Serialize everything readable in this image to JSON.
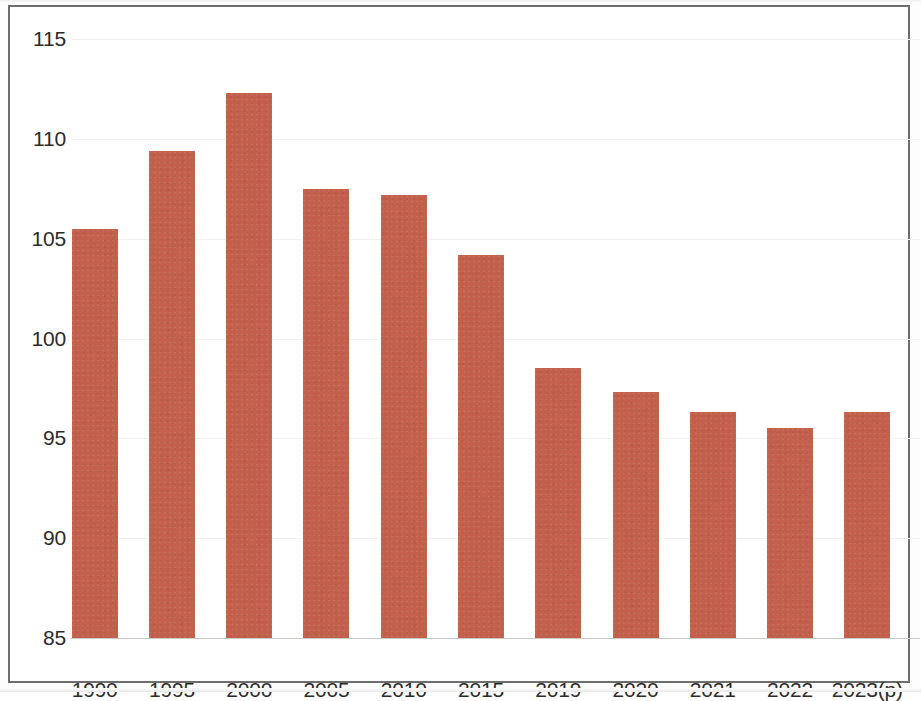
{
  "chart_data": {
    "type": "bar",
    "title": "",
    "subtitle": "",
    "xlabel": "",
    "ylabel": "",
    "categories": [
      "1990",
      "1995",
      "2000",
      "2005",
      "2010",
      "2015",
      "2019",
      "2020",
      "2021",
      "2022",
      "2023(p)"
    ],
    "values": [
      105.5,
      109.4,
      112.3,
      107.5,
      107.2,
      104.2,
      98.5,
      97.3,
      96.3,
      95.5,
      96.3
    ],
    "series": [
      {
        "name": "",
        "values": [
          105.5,
          109.4,
          112.3,
          107.5,
          107.2,
          104.2,
          98.5,
          97.3,
          96.3,
          95.5,
          96.3
        ]
      }
    ],
    "ylim": [
      85,
      115
    ],
    "xlim": [
      0,
      11
    ],
    "y_ticks": [
      85,
      90,
      95,
      100,
      105,
      110,
      115
    ],
    "y_tick_labels": [
      "85",
      "90",
      "95",
      "100",
      "105",
      "110",
      "115"
    ],
    "x_tick_labels": [
      "1990",
      "1995",
      "2000",
      "2005",
      "2010",
      "2015",
      "2019",
      "2020",
      "2021",
      "2022",
      "2023(p)"
    ],
    "grid": true,
    "grid_axis": "y",
    "legend": false,
    "legend_position": "none",
    "annotations": [],
    "bar_color": "#c2604c",
    "grid_color": "#f2f2f2",
    "axis_color": "#6d6d6d",
    "text_color": "#2b2b2b",
    "background_color": "#ffffff"
  },
  "figure": {
    "frame_visible": true,
    "plot": {
      "left_px": 60,
      "top_px": 32,
      "width_px": 850,
      "height_px": 599
    }
  }
}
